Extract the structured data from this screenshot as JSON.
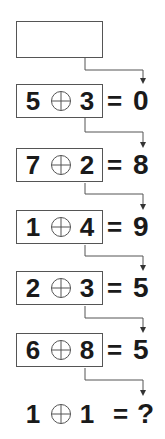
{
  "puzzle": {
    "operator_symbol": "circled-plus",
    "rows": [
      {
        "a": "",
        "b": "",
        "result": "",
        "empty": true
      },
      {
        "a": "5",
        "b": "3",
        "result": "0"
      },
      {
        "a": "7",
        "b": "2",
        "result": "8"
      },
      {
        "a": "1",
        "b": "4",
        "result": "9"
      },
      {
        "a": "2",
        "b": "3",
        "result": "5"
      },
      {
        "a": "6",
        "b": "8",
        "result": "5"
      },
      {
        "a": "1",
        "b": "1",
        "result": "?"
      }
    ],
    "equals": "="
  }
}
